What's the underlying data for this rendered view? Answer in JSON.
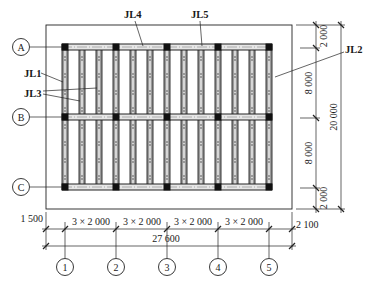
{
  "drawing": {
    "type": "foundation beam plan",
    "beam_labels": [
      {
        "id": "JL1",
        "text": "JL1"
      },
      {
        "id": "JL2",
        "text": "JL2"
      },
      {
        "id": "JL3",
        "text": "JL3"
      },
      {
        "id": "JL4",
        "text": "JL4"
      },
      {
        "id": "JL5",
        "text": "JL5"
      }
    ],
    "row_axes": [
      {
        "label": "A"
      },
      {
        "label": "B"
      },
      {
        "label": "C"
      }
    ],
    "column_axes": [
      {
        "label": "1"
      },
      {
        "label": "2"
      },
      {
        "label": "3"
      },
      {
        "label": "4"
      },
      {
        "label": "5"
      }
    ],
    "dimensions": {
      "bottom_left_overhang": "1 500",
      "bays": [
        "3 × 2 000",
        "3 × 2 000",
        "3 × 2 000",
        "3 × 2 000"
      ],
      "bottom_right_overhang": "2 100",
      "overall_width": "27 600",
      "right_segments": [
        "2 000",
        "8 000",
        "8 000",
        "2 000"
      ],
      "overall_height": "20 000"
    },
    "colors": {
      "line": "#222222",
      "beam_fill": "#9a9a9a",
      "column": "#111111",
      "background": "#ffffff"
    }
  }
}
